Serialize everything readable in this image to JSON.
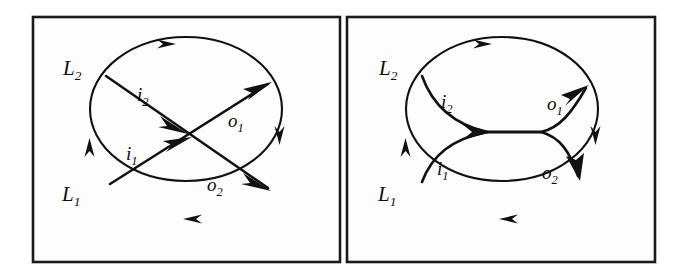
{
  "figure": {
    "background_color": "#ffffff",
    "stroke_color": "#111111",
    "frame_color": "#1b1b1b",
    "panels": [
      {
        "id": "left-panel",
        "name": "crossing-diagram",
        "description": "Ellipse with two straight crossing arrows from inputs to outputs",
        "labels": {
          "input_lower": {
            "base": "i",
            "sub": "1",
            "text": "i1"
          },
          "input_upper": {
            "base": "i",
            "sub": "2",
            "text": "i2"
          },
          "output_upper": {
            "base": "o",
            "sub": "1",
            "text": "o1"
          },
          "output_lower": {
            "base": "o",
            "sub": "2",
            "text": "o2"
          },
          "node_lower": {
            "base": "L",
            "sub": "1",
            "text": "L1"
          },
          "node_upper": {
            "base": "L",
            "sub": "2",
            "text": "L2"
          }
        },
        "boundary_arrow_directions": [
          "right",
          "down",
          "left",
          "up"
        ]
      },
      {
        "id": "right-panel",
        "name": "merge-split-diagram",
        "description": "Ellipse with two curved inputs merging into a horizontal segment that splits into two curved outputs",
        "labels": {
          "input_lower": {
            "base": "i",
            "sub": "1",
            "text": "i1"
          },
          "input_upper": {
            "base": "i",
            "sub": "2",
            "text": "i2"
          },
          "output_upper": {
            "base": "o",
            "sub": "1",
            "text": "o1"
          },
          "output_lower": {
            "base": "o",
            "sub": "2",
            "text": "o2"
          },
          "node_lower": {
            "base": "L",
            "sub": "1",
            "text": "L1"
          },
          "node_upper": {
            "base": "L",
            "sub": "2",
            "text": "L2"
          }
        },
        "boundary_arrow_directions": [
          "right",
          "down",
          "left",
          "up"
        ]
      }
    ]
  }
}
